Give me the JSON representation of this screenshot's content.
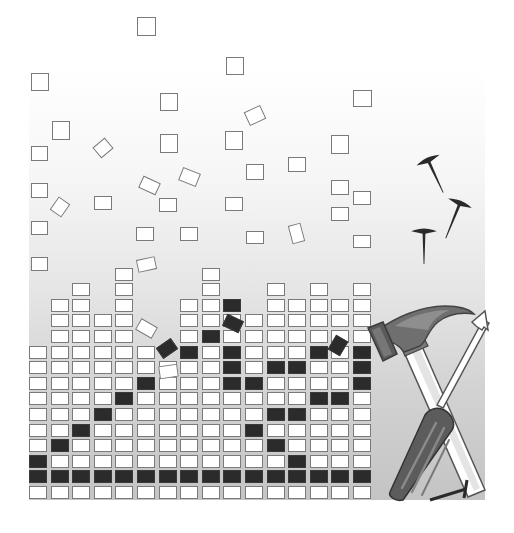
{
  "scene": {
    "title": "Building blocks with hammer and screwdriver",
    "colors": {
      "cell_fill": "#ffffff",
      "cell_border": "#7a7a7a",
      "dark_cell": "#2b2b2b",
      "hammer_head": "#6b6b6b",
      "screwdriver_handle": "#5a5a5a",
      "nail": "#2a2a2a"
    },
    "grid": {
      "origin_x": 29,
      "bottom_y": 486,
      "col_pitch": 21.6,
      "row_pitch": 15.6,
      "columns": [
        {
          "col": 0,
          "rows": 10
        },
        {
          "col": 1,
          "rows": 13
        },
        {
          "col": 2,
          "rows": 14
        },
        {
          "col": 3,
          "rows": 12
        },
        {
          "col": 4,
          "rows": 15
        },
        {
          "col": 5,
          "rows": 10
        },
        {
          "col": 6,
          "rows": 9
        },
        {
          "col": 7,
          "rows": 13
        },
        {
          "col": 8,
          "rows": 15
        },
        {
          "col": 9,
          "rows": 13
        },
        {
          "col": 10,
          "rows": 12
        },
        {
          "col": 11,
          "rows": 14
        },
        {
          "col": 12,
          "rows": 13
        },
        {
          "col": 13,
          "rows": 14
        },
        {
          "col": 14,
          "rows": 13
        },
        {
          "col": 15,
          "rows": 14
        }
      ],
      "dark_row": 1,
      "dark_cells": [
        [
          0,
          2
        ],
        [
          1,
          3
        ],
        [
          2,
          4
        ],
        [
          3,
          5
        ],
        [
          4,
          6
        ],
        [
          5,
          7
        ],
        [
          7,
          9
        ],
        [
          8,
          10
        ],
        [
          9,
          7
        ],
        [
          9,
          8
        ],
        [
          9,
          9
        ],
        [
          9,
          12
        ],
        [
          10,
          4
        ],
        [
          10,
          7
        ],
        [
          11,
          3
        ],
        [
          11,
          5
        ],
        [
          11,
          8
        ],
        [
          12,
          2
        ],
        [
          12,
          5
        ],
        [
          12,
          8
        ],
        [
          13,
          6
        ],
        [
          13,
          9
        ],
        [
          14,
          6
        ],
        [
          15,
          7
        ],
        [
          15,
          8
        ],
        [
          15,
          9
        ]
      ]
    },
    "floating": [
      {
        "x": 137,
        "y": 17,
        "w": 19,
        "h": 19,
        "r": 0
      },
      {
        "x": 31,
        "y": 73,
        "w": 18,
        "h": 18,
        "r": 0
      },
      {
        "x": 226,
        "y": 57,
        "w": 18,
        "h": 18,
        "r": 0
      },
      {
        "x": 160,
        "y": 93,
        "w": 18,
        "h": 18,
        "r": 0
      },
      {
        "x": 353,
        "y": 90,
        "w": 19,
        "h": 17,
        "r": 0
      },
      {
        "x": 52,
        "y": 121,
        "w": 18,
        "h": 19,
        "r": 0
      },
      {
        "x": 246,
        "y": 108,
        "w": 18,
        "h": 15,
        "r": -25
      },
      {
        "x": 31,
        "y": 146,
        "w": 17,
        "h": 15,
        "r": 0
      },
      {
        "x": 95,
        "y": 141,
        "w": 16,
        "h": 14,
        "r": -40
      },
      {
        "x": 160,
        "y": 134,
        "w": 18,
        "h": 19,
        "r": 0
      },
      {
        "x": 225,
        "y": 131,
        "w": 18,
        "h": 19,
        "r": 0
      },
      {
        "x": 331,
        "y": 135,
        "w": 18,
        "h": 19,
        "r": 0
      },
      {
        "x": 288,
        "y": 157,
        "w": 18,
        "h": 15,
        "r": 0
      },
      {
        "x": 246,
        "y": 164,
        "w": 18,
        "h": 16,
        "r": 0
      },
      {
        "x": 31,
        "y": 183,
        "w": 17,
        "h": 15,
        "r": 0
      },
      {
        "x": 140,
        "y": 179,
        "w": 19,
        "h": 13,
        "r": 25
      },
      {
        "x": 180,
        "y": 170,
        "w": 19,
        "h": 14,
        "r": 22
      },
      {
        "x": 331,
        "y": 180,
        "w": 18,
        "h": 15,
        "r": 0
      },
      {
        "x": 52,
        "y": 200,
        "w": 16,
        "h": 14,
        "r": -55
      },
      {
        "x": 94,
        "y": 196,
        "w": 18,
        "h": 14,
        "r": 0
      },
      {
        "x": 159,
        "y": 198,
        "w": 18,
        "h": 14,
        "r": 0
      },
      {
        "x": 225,
        "y": 197,
        "w": 18,
        "h": 14,
        "r": 0
      },
      {
        "x": 331,
        "y": 207,
        "w": 18,
        "h": 14,
        "r": 0
      },
      {
        "x": 353,
        "y": 191,
        "w": 18,
        "h": 14,
        "r": 0
      },
      {
        "x": 31,
        "y": 221,
        "w": 17,
        "h": 14,
        "r": 0
      },
      {
        "x": 136,
        "y": 227,
        "w": 18,
        "h": 14,
        "r": 0
      },
      {
        "x": 180,
        "y": 227,
        "w": 18,
        "h": 14,
        "r": 0
      },
      {
        "x": 246,
        "y": 231,
        "w": 18,
        "h": 13,
        "r": 0
      },
      {
        "x": 290,
        "y": 224,
        "w": 13,
        "h": 19,
        "r": -15
      },
      {
        "x": 353,
        "y": 235,
        "w": 18,
        "h": 13,
        "r": 0
      },
      {
        "x": 31,
        "y": 257,
        "w": 17,
        "h": 14,
        "r": 0
      },
      {
        "x": 137,
        "y": 258,
        "w": 19,
        "h": 13,
        "r": -12
      },
      {
        "x": 137,
        "y": 322,
        "w": 19,
        "h": 13,
        "r": 30
      },
      {
        "x": 159,
        "y": 365,
        "w": 19,
        "h": 13,
        "r": -8
      }
    ],
    "floating_dark": [
      {
        "x": 158,
        "y": 342,
        "w": 18,
        "h": 13,
        "r": -35
      },
      {
        "x": 224,
        "y": 317,
        "w": 18,
        "h": 13,
        "r": 25
      },
      {
        "x": 331,
        "y": 337,
        "w": 14,
        "h": 17,
        "r": 30
      }
    ],
    "nails": [
      {
        "x": 428,
        "y": 160,
        "len": 36,
        "angle": -25
      },
      {
        "x": 460,
        "y": 203,
        "len": 38,
        "angle": 22
      },
      {
        "x": 424,
        "y": 231,
        "len": 33,
        "angle": 0
      }
    ],
    "tools": [
      "hammer",
      "screwdriver"
    ]
  }
}
